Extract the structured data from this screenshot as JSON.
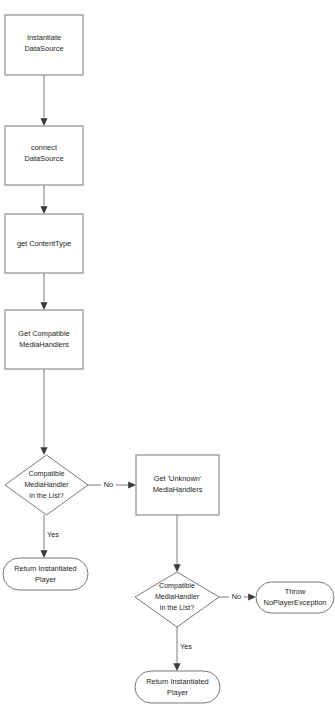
{
  "diagram": {
    "type": "flowchart",
    "background_color": "#ffffff",
    "shape_stroke_color": "#787878",
    "edge_color": "#7d7d7d",
    "text_color": "#1d1d1d",
    "nodes": [
      {
        "id": "instantiate_datasource",
        "shape": "process",
        "lines": [
          "Instantiate",
          "DataSource"
        ]
      },
      {
        "id": "connect_datasource",
        "shape": "process",
        "lines": [
          "connect",
          "DataSource"
        ]
      },
      {
        "id": "get_contenttype",
        "shape": "process",
        "lines": [
          "get ContentType"
        ]
      },
      {
        "id": "get_compatible_mediahandlers",
        "shape": "process",
        "lines": [
          "Get Compatible",
          "MediaHandlers"
        ]
      },
      {
        "id": "decision_compatible_1",
        "shape": "decision",
        "lines": [
          "Compatible",
          "MediaHandler",
          "in the List?"
        ]
      },
      {
        "id": "get_unknown_mediahandlers",
        "shape": "process",
        "lines": [
          "Get 'Unknown'",
          "MediaHandlers"
        ]
      },
      {
        "id": "return_player_1",
        "shape": "terminator",
        "lines": [
          "Return Instantiated",
          "Player"
        ]
      },
      {
        "id": "decision_compatible_2",
        "shape": "decision",
        "lines": [
          "Compatible",
          "MediaHandler",
          "in the List?"
        ]
      },
      {
        "id": "throw_noplayerexception",
        "shape": "terminator",
        "lines": [
          "Throw",
          "NoPlayerException"
        ]
      },
      {
        "id": "return_player_2",
        "shape": "terminator",
        "lines": [
          "Return Instantiated",
          "Player"
        ]
      }
    ],
    "edges": [
      {
        "id": "e1",
        "from": "instantiate_datasource",
        "to": "connect_datasource",
        "label": ""
      },
      {
        "id": "e2",
        "from": "connect_datasource",
        "to": "get_contenttype",
        "label": ""
      },
      {
        "id": "e3",
        "from": "get_contenttype",
        "to": "get_compatible_mediahandlers",
        "label": ""
      },
      {
        "id": "e4",
        "from": "get_compatible_mediahandlers",
        "to": "decision_compatible_1",
        "label": ""
      },
      {
        "id": "e5",
        "from": "decision_compatible_1",
        "to": "get_unknown_mediahandlers",
        "label": "No"
      },
      {
        "id": "e6",
        "from": "decision_compatible_1",
        "to": "return_player_1",
        "label": "Yes"
      },
      {
        "id": "e7",
        "from": "get_unknown_mediahandlers",
        "to": "decision_compatible_2",
        "label": ""
      },
      {
        "id": "e8",
        "from": "decision_compatible_2",
        "to": "throw_noplayerexception",
        "label": "No"
      },
      {
        "id": "e9",
        "from": "decision_compatible_2",
        "to": "return_player_2",
        "label": "Yes"
      }
    ],
    "edge_labels": {
      "no_1": "No",
      "yes_1": "Yes",
      "no_2": "No",
      "yes_2": "Yes"
    }
  }
}
